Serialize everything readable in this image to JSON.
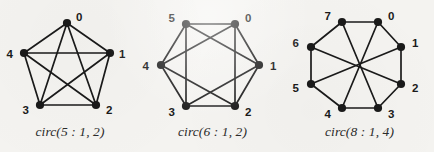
{
  "figure": {
    "background_color": "#f4f3f0",
    "ink_color": "#1a1a1a",
    "panel_count": 3
  },
  "panels": [
    {
      "id": "circ-5-1-2",
      "caption_prefix": "circ",
      "caption": "circ(5 : 1, 2)",
      "n": 5,
      "connection_set": [
        1,
        2
      ],
      "node_labels": [
        "0",
        "1",
        "2",
        "3",
        "4"
      ]
    },
    {
      "id": "circ-6-1-2",
      "caption_prefix": "circ",
      "caption": "circ(6 : 1, 2)",
      "n": 6,
      "connection_set": [
        1,
        2
      ],
      "node_labels": [
        "0",
        "1",
        "2",
        "3",
        "4",
        "5"
      ]
    },
    {
      "id": "circ-8-1-4",
      "caption_prefix": "circ",
      "caption": "circ(8 : 1, 4)",
      "n": 8,
      "connection_set": [
        1,
        4
      ],
      "node_labels": [
        "0",
        "1",
        "2",
        "3",
        "4",
        "5",
        "6",
        "7"
      ]
    }
  ],
  "chart_data": {
    "type": "diagram",
    "title": "",
    "graphs": [
      {
        "name": "circ(5 : 1, 2)",
        "n": 5,
        "connection_set": [
          1,
          2
        ],
        "vertices": [
          {
            "label": "0",
            "x": 67,
            "y": 23,
            "label_dx": 9,
            "label_dy": -6
          },
          {
            "label": "1",
            "x": 110,
            "y": 53,
            "label_dx": 9,
            "label_dy": 1
          },
          {
            "label": "2",
            "x": 96,
            "y": 105,
            "label_dx": 10,
            "label_dy": 5
          },
          {
            "label": "3",
            "x": 40,
            "y": 105,
            "label_dx": -11,
            "label_dy": 5
          },
          {
            "label": "4",
            "x": 24,
            "y": 53,
            "label_dx": -11,
            "label_dy": 1
          }
        ],
        "edges": [
          [
            0,
            1
          ],
          [
            1,
            2
          ],
          [
            2,
            3
          ],
          [
            3,
            4
          ],
          [
            4,
            0
          ],
          [
            0,
            2
          ],
          [
            1,
            3
          ],
          [
            2,
            4
          ],
          [
            3,
            0
          ],
          [
            4,
            1
          ]
        ],
        "edge_count": 10
      },
      {
        "name": "circ(6 : 1, 2)",
        "n": 6,
        "connection_set": [
          1,
          2
        ],
        "vertices": [
          {
            "label": "0",
            "x": 235,
            "y": 24,
            "label_dx": 10,
            "label_dy": -6
          },
          {
            "label": "1",
            "x": 259,
            "y": 65,
            "label_dx": 11,
            "label_dy": 1
          },
          {
            "label": "2",
            "x": 235,
            "y": 106,
            "label_dx": 10,
            "label_dy": 6
          },
          {
            "label": "3",
            "x": 186,
            "y": 106,
            "label_dx": -11,
            "label_dy": 6
          },
          {
            "label": "4",
            "x": 161,
            "y": 65,
            "label_dx": -12,
            "label_dy": 1
          },
          {
            "label": "5",
            "x": 186,
            "y": 24,
            "label_dx": -11,
            "label_dy": -6
          }
        ],
        "edges": [
          [
            0,
            1
          ],
          [
            1,
            2
          ],
          [
            2,
            3
          ],
          [
            3,
            4
          ],
          [
            4,
            5
          ],
          [
            5,
            0
          ],
          [
            0,
            2
          ],
          [
            1,
            3
          ],
          [
            2,
            4
          ],
          [
            3,
            5
          ],
          [
            4,
            0
          ],
          [
            5,
            1
          ]
        ],
        "edge_count": 12
      },
      {
        "name": "circ(8 : 1, 4)",
        "n": 8,
        "connection_set": [
          1,
          4
        ],
        "vertices": [
          {
            "label": "0",
            "x": 378,
            "y": 22,
            "label_dx": 10,
            "label_dy": -6
          },
          {
            "label": "1",
            "x": 401,
            "y": 47,
            "label_dx": 11,
            "label_dy": -4
          },
          {
            "label": "2",
            "x": 401,
            "y": 84,
            "label_dx": 11,
            "label_dy": 4
          },
          {
            "label": "3",
            "x": 378,
            "y": 108,
            "label_dx": 10,
            "label_dy": 6
          },
          {
            "label": "4",
            "x": 342,
            "y": 108,
            "label_dx": -11,
            "label_dy": 6
          },
          {
            "label": "5",
            "x": 311,
            "y": 84,
            "label_dx": -12,
            "label_dy": 4
          },
          {
            "label": "6",
            "x": 311,
            "y": 47,
            "label_dx": -12,
            "label_dy": -4
          },
          {
            "label": "7",
            "x": 342,
            "y": 22,
            "label_dx": -11,
            "label_dy": -6
          }
        ],
        "edges": [
          [
            0,
            1
          ],
          [
            1,
            2
          ],
          [
            2,
            3
          ],
          [
            3,
            4
          ],
          [
            4,
            5
          ],
          [
            5,
            6
          ],
          [
            6,
            7
          ],
          [
            7,
            0
          ],
          [
            0,
            4
          ],
          [
            1,
            5
          ],
          [
            2,
            6
          ],
          [
            3,
            7
          ]
        ],
        "edge_count": 12
      }
    ]
  },
  "captions": {
    "panel0": "circ(5 : 1, 2)",
    "panel1": "circ(6 : 1, 2)",
    "panel2": "circ(8 : 1, 4)"
  }
}
